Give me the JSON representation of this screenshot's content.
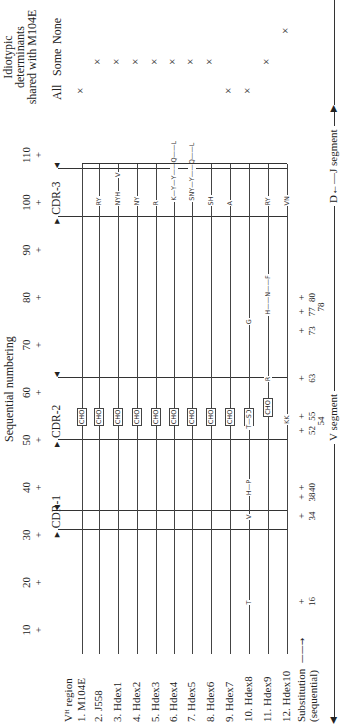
{
  "title": "Sequential numbering",
  "idiotypic_header": [
    "Idiotypic",
    "determinants",
    "shared with M104E"
  ],
  "idiotypic_columns": [
    "All",
    "Some",
    "None"
  ],
  "sequence_ticks": [
    "10",
    "20",
    "30",
    "40",
    "50",
    "60",
    "70",
    "80",
    "90",
    "100",
    "110"
  ],
  "tick_glyph": "+",
  "cdrs": [
    {
      "label": "CDR-1",
      "start": 31,
      "end": 35
    },
    {
      "label": "CDR-2",
      "start": 50,
      "end": 63
    },
    {
      "label": "CDR-3",
      "start": 97,
      "end": 107
    }
  ],
  "region_header": "Vᴴ region",
  "rows": [
    {
      "label": "1.  M104E",
      "idiotype": "All",
      "subs": [],
      "cho": true
    },
    {
      "label": "2.  J558",
      "idiotype": "Some",
      "subs": [
        {
          "pos": 100,
          "text": "RY"
        }
      ],
      "cho": true
    },
    {
      "label": "3.  Hdex1",
      "idiotype": "Some",
      "subs": [
        {
          "pos": 100,
          "text": "NYH"
        },
        {
          "pos": 106,
          "text": "V"
        }
      ],
      "cho": true
    },
    {
      "label": "4.  Hdex2",
      "idiotype": "Some",
      "subs": [
        {
          "pos": 100,
          "text": "NY"
        }
      ],
      "cho": true
    },
    {
      "label": "5.  Hdex3",
      "idiotype": "Some",
      "subs": [
        {
          "pos": 100,
          "text": "R"
        }
      ],
      "cho": true
    },
    {
      "label": "6.  Hdex4",
      "idiotype": "Some",
      "subs": [
        {
          "pos": 101,
          "text": "K—Y—Y——Q——L"
        }
      ],
      "cho": true
    },
    {
      "label": "7.  Hdex5",
      "idiotype": "Some",
      "subs": [
        {
          "pos": 101,
          "text": "SNY—Y——Q——L"
        }
      ],
      "cho": true
    },
    {
      "label": "8.  Hdex6",
      "idiotype": "Some",
      "subs": [
        {
          "pos": 100,
          "text": "SH"
        }
      ],
      "cho": true
    },
    {
      "label": "9.  Hdex7",
      "idiotype": "All",
      "subs": [
        {
          "pos": 100,
          "text": "A"
        }
      ],
      "cho": true
    },
    {
      "label": "10.  Hdex8",
      "idiotype": "All",
      "subs": [
        {
          "pos": 16,
          "text": "T"
        },
        {
          "pos": 34,
          "text": "V"
        },
        {
          "pos": 39,
          "text": "H—P"
        },
        {
          "pos": 53,
          "text": "T—S"
        },
        {
          "pos": 75,
          "text": "G"
        }
      ],
      "cho": true
    },
    {
      "label": "11.  Hdex9",
      "idiotype": "Some",
      "subs": [
        {
          "pos": 63,
          "text": "R"
        },
        {
          "pos": 77,
          "text": "H——N——F"
        },
        {
          "pos": 100,
          "text": "RY"
        }
      ],
      "cho": true
    },
    {
      "label": "12.  Hdex10",
      "idiotype": "None",
      "subs": [
        {
          "pos": 54,
          "text": "KK"
        },
        {
          "pos": 100,
          "text": "VN"
        }
      ],
      "cho": false
    }
  ],
  "cho_label": "CHO",
  "idiotype_mark": "×",
  "substitution": {
    "label_line1": "Substitution",
    "label_line2": "(sequential)",
    "positions": [
      {
        "num": "16",
        "pos": 16
      },
      {
        "num": "34",
        "pos": 34
      },
      {
        "num": "38",
        "pos": 38
      },
      {
        "num": "40",
        "pos": 40
      },
      {
        "num": "52",
        "pos": 52
      },
      {
        "num": "54",
        "pos": 54,
        "low": true
      },
      {
        "num": "55",
        "pos": 55
      },
      {
        "num": "63",
        "pos": 63
      },
      {
        "num": "73",
        "pos": 73
      },
      {
        "num": "77",
        "pos": 77
      },
      {
        "num": "78",
        "pos": 78,
        "low": true
      },
      {
        "num": "80",
        "pos": 80
      }
    ]
  },
  "segments": {
    "v": "V segment",
    "dj": "D←—J segment"
  }
}
